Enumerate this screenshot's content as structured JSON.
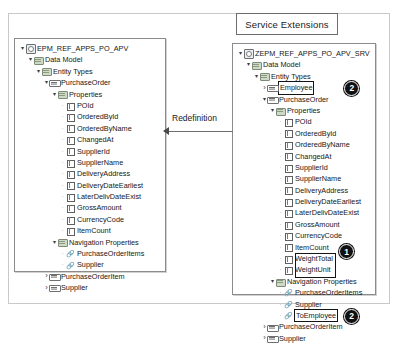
{
  "callout": {
    "service_extensions_label": "Service Extensions"
  },
  "connector": {
    "redefinition_label": "Redefinition",
    "arrow_direction": "left"
  },
  "badges": {
    "one": "1",
    "two": "2"
  },
  "left_panel": {
    "name": "base-service-tree",
    "rows": [
      {
        "depth": 0,
        "twisty": "open",
        "icon": "root-icon",
        "label": "EPM_REF_APPS_PO_APV"
      },
      {
        "depth": 1,
        "twisty": "open",
        "icon": "folder-icon",
        "label": "Data Model"
      },
      {
        "depth": 2,
        "twisty": "open",
        "icon": "folder-icon",
        "label": "Entity Types"
      },
      {
        "depth": 3,
        "twisty": "open",
        "icon": "entity-icon",
        "label": "PurchaseOrder"
      },
      {
        "depth": 4,
        "twisty": "open",
        "icon": "folder-icon",
        "label": "Properties"
      },
      {
        "depth": 5,
        "twisty": "none",
        "icon": "property-icon",
        "label": "POId"
      },
      {
        "depth": 5,
        "twisty": "none",
        "icon": "property-icon",
        "label": "OrderedById"
      },
      {
        "depth": 5,
        "twisty": "none",
        "icon": "property-icon",
        "label": "OrderedByName"
      },
      {
        "depth": 5,
        "twisty": "none",
        "icon": "property-icon",
        "label": "ChangedAt"
      },
      {
        "depth": 5,
        "twisty": "none",
        "icon": "property-icon",
        "label": "SupplierId"
      },
      {
        "depth": 5,
        "twisty": "none",
        "icon": "property-icon",
        "label": "SupplierName"
      },
      {
        "depth": 5,
        "twisty": "none",
        "icon": "property-icon",
        "label": "DeliveryAddress"
      },
      {
        "depth": 5,
        "twisty": "none",
        "icon": "property-icon",
        "label": "DeliveryDateEarliest"
      },
      {
        "depth": 5,
        "twisty": "none",
        "icon": "property-icon",
        "label": "LaterDelivDateExist"
      },
      {
        "depth": 5,
        "twisty": "none",
        "icon": "property-icon",
        "label": "GrossAmount"
      },
      {
        "depth": 5,
        "twisty": "none",
        "icon": "property-icon",
        "label": "CurrencyCode"
      },
      {
        "depth": 5,
        "twisty": "none",
        "icon": "property-icon",
        "label": "ItemCount"
      },
      {
        "depth": 4,
        "twisty": "open",
        "icon": "folder-icon",
        "label": "Navigation Properties"
      },
      {
        "depth": 5,
        "twisty": "none",
        "icon": "nav-icon",
        "label": "PurchaseOrderItems"
      },
      {
        "depth": 5,
        "twisty": "none",
        "icon": "nav-icon",
        "label": "Supplier"
      },
      {
        "depth": 3,
        "twisty": "closed",
        "icon": "entity-icon",
        "label": "PurchaseOrderItem"
      },
      {
        "depth": 3,
        "twisty": "closed",
        "icon": "entity-icon",
        "label": "Supplier"
      }
    ]
  },
  "right_panel": {
    "name": "extended-service-tree",
    "rows": [
      {
        "depth": 0,
        "twisty": "open",
        "icon": "root-icon",
        "label": "ZEPM_REF_APPS_PO_APV_SRV"
      },
      {
        "depth": 1,
        "twisty": "open",
        "icon": "folder-icon",
        "label": "Data Model"
      },
      {
        "depth": 2,
        "twisty": "open",
        "icon": "folder-icon",
        "label": "Entity Types"
      },
      {
        "depth": 3,
        "twisty": "closed",
        "icon": "entity-icon",
        "label": "Employee",
        "highlight": true
      },
      {
        "depth": 3,
        "twisty": "open",
        "icon": "entity-icon",
        "label": "PurchaseOrder"
      },
      {
        "depth": 4,
        "twisty": "open",
        "icon": "folder-icon",
        "label": "Properties"
      },
      {
        "depth": 5,
        "twisty": "none",
        "icon": "property-icon",
        "label": "POId"
      },
      {
        "depth": 5,
        "twisty": "none",
        "icon": "property-icon",
        "label": "OrderedById"
      },
      {
        "depth": 5,
        "twisty": "none",
        "icon": "property-icon",
        "label": "OrderedByName"
      },
      {
        "depth": 5,
        "twisty": "none",
        "icon": "property-icon",
        "label": "ChangedAt"
      },
      {
        "depth": 5,
        "twisty": "none",
        "icon": "property-icon",
        "label": "SupplierId"
      },
      {
        "depth": 5,
        "twisty": "none",
        "icon": "property-icon",
        "label": "SupplierName"
      },
      {
        "depth": 5,
        "twisty": "none",
        "icon": "property-icon",
        "label": "DeliveryAddress"
      },
      {
        "depth": 5,
        "twisty": "none",
        "icon": "property-icon",
        "label": "DeliveryDateEarliest"
      },
      {
        "depth": 5,
        "twisty": "none",
        "icon": "property-icon",
        "label": "LaterDelivDateExist"
      },
      {
        "depth": 5,
        "twisty": "none",
        "icon": "property-icon",
        "label": "GrossAmount"
      },
      {
        "depth": 5,
        "twisty": "none",
        "icon": "property-icon",
        "label": "CurrencyCode"
      },
      {
        "depth": 5,
        "twisty": "none",
        "icon": "property-icon",
        "label": "ItemCount"
      },
      {
        "depth": 5,
        "twisty": "none",
        "icon": "property-icon",
        "label": "WeightTotal"
      },
      {
        "depth": 5,
        "twisty": "none",
        "icon": "property-icon",
        "label": "WeightUnit"
      },
      {
        "depth": 4,
        "twisty": "open",
        "icon": "folder-icon",
        "label": "Navigation Properties"
      },
      {
        "depth": 5,
        "twisty": "none",
        "icon": "nav-icon",
        "label": "PurchaseOrderItems"
      },
      {
        "depth": 5,
        "twisty": "none",
        "icon": "nav-icon",
        "label": "Supplier"
      },
      {
        "depth": 5,
        "twisty": "none",
        "icon": "nav-icon",
        "label": "ToEmployee",
        "highlight": true
      },
      {
        "depth": 3,
        "twisty": "closed",
        "icon": "entity-icon",
        "label": "PurchaseOrderItem"
      },
      {
        "depth": 3,
        "twisty": "closed",
        "icon": "entity-icon",
        "label": "Supplier"
      }
    ]
  }
}
